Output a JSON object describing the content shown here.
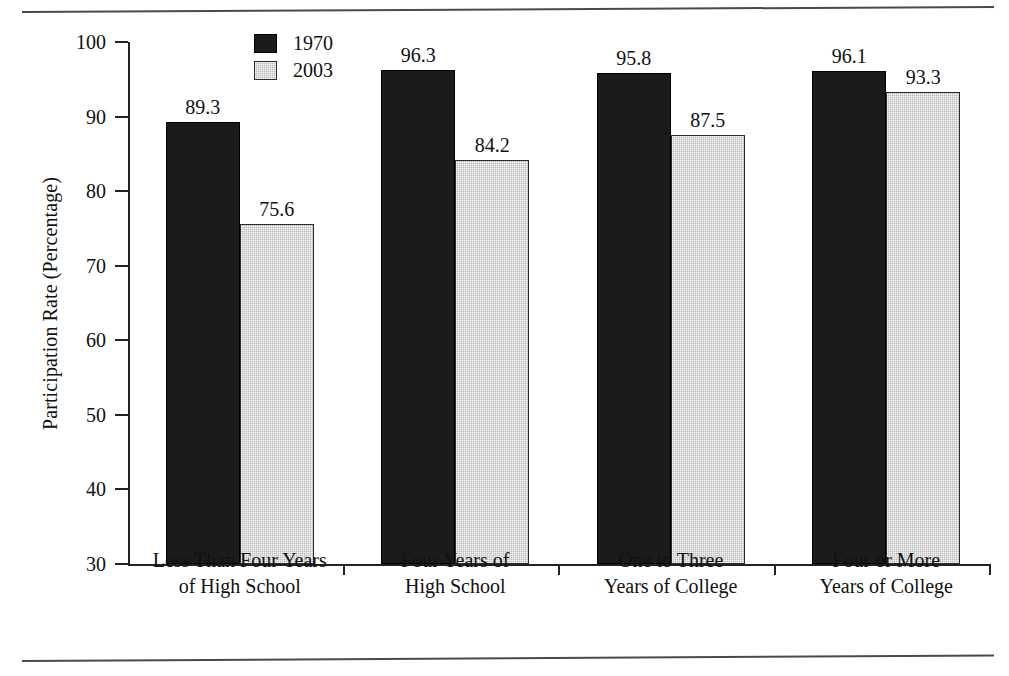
{
  "chart_data": {
    "type": "bar",
    "title": "",
    "xlabel": "",
    "ylabel": "Participation Rate (Percentage)",
    "ylim": [
      30,
      100
    ],
    "yticks": [
      30,
      40,
      50,
      60,
      70,
      80,
      90,
      100
    ],
    "grid": false,
    "legend_position": "top-center-left",
    "categories": [
      "Less Than Four Years\nof High School",
      "Four Years of\nHigh School",
      "One to Three\nYears of College",
      "Four or More\nYears of College"
    ],
    "series": [
      {
        "name": "1970",
        "color": "#1b1b1b",
        "values": [
          89.3,
          96.3,
          95.8,
          96.1
        ],
        "labels": [
          "89.3",
          "96.3",
          "95.8",
          "96.1"
        ]
      },
      {
        "name": "2003",
        "color": "#b9b9b9",
        "values": [
          75.6,
          84.2,
          87.5,
          93.3
        ],
        "labels": [
          "75.6",
          "84.2",
          "87.5",
          "93.3"
        ]
      }
    ]
  },
  "legend": {
    "items": [
      {
        "label": "1970"
      },
      {
        "label": "2003"
      }
    ]
  },
  "axis": {
    "y_title": "Participation Rate (Percentage)",
    "tick_labels": [
      "100",
      "90",
      "80",
      "70",
      "60",
      "50",
      "40",
      "30"
    ]
  }
}
